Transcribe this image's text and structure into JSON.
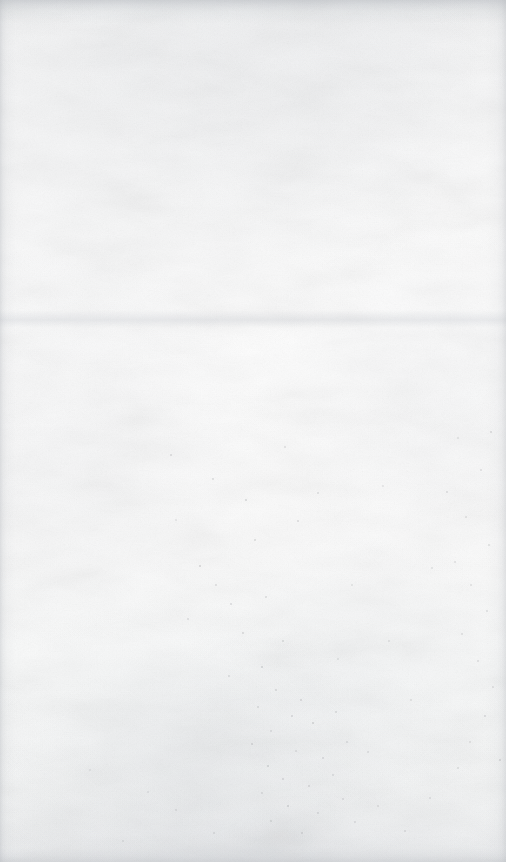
{
  "page": {
    "kind": "scanned-blank-page",
    "width": 506,
    "height": 862,
    "visible_text": "",
    "caption": ""
  },
  "appearance": {
    "base_color": "#fcfcfc",
    "paper_highlight": "#fdfdfd",
    "paper_shadow": "#f2f3f4",
    "edge_shadow_color": "#acb0b6",
    "speck_color": "#8d8f93",
    "crease_color": "#bec2c8"
  },
  "regions": {
    "top_edge_band": {
      "label": "",
      "y": 0,
      "height": 14
    },
    "bottom_edge_band": {
      "label": "",
      "y": 840,
      "height": 22
    },
    "left_edge_band": {
      "label": "",
      "x": 0,
      "width": 6
    },
    "right_edge_band": {
      "label": "",
      "x": 496,
      "width": 10
    },
    "crease": {
      "label": "",
      "y": 318
    }
  },
  "specks": [
    {
      "x": 171,
      "y": 455,
      "r": 1.0,
      "o": 0.3
    },
    {
      "x": 213,
      "y": 479,
      "r": 0.9,
      "o": 0.26
    },
    {
      "x": 246,
      "y": 500,
      "r": 1.1,
      "o": 0.32
    },
    {
      "x": 285,
      "y": 447,
      "r": 0.8,
      "o": 0.24
    },
    {
      "x": 298,
      "y": 521,
      "r": 1.0,
      "o": 0.3
    },
    {
      "x": 318,
      "y": 493,
      "r": 0.9,
      "o": 0.25
    },
    {
      "x": 255,
      "y": 540,
      "r": 1.0,
      "o": 0.28
    },
    {
      "x": 200,
      "y": 566,
      "r": 1.2,
      "o": 0.34
    },
    {
      "x": 216,
      "y": 585,
      "r": 0.9,
      "o": 0.24
    },
    {
      "x": 231,
      "y": 604,
      "r": 1.0,
      "o": 0.29
    },
    {
      "x": 188,
      "y": 619,
      "r": 0.8,
      "o": 0.22
    },
    {
      "x": 243,
      "y": 633,
      "r": 1.1,
      "o": 0.31
    },
    {
      "x": 266,
      "y": 597,
      "r": 0.9,
      "o": 0.26
    },
    {
      "x": 283,
      "y": 641,
      "r": 1.0,
      "o": 0.28
    },
    {
      "x": 262,
      "y": 667,
      "r": 1.2,
      "o": 0.33
    },
    {
      "x": 229,
      "y": 676,
      "r": 0.9,
      "o": 0.25
    },
    {
      "x": 276,
      "y": 690,
      "r": 1.0,
      "o": 0.3
    },
    {
      "x": 301,
      "y": 700,
      "r": 1.1,
      "o": 0.31
    },
    {
      "x": 258,
      "y": 707,
      "r": 0.9,
      "o": 0.26
    },
    {
      "x": 292,
      "y": 716,
      "r": 1.0,
      "o": 0.29
    },
    {
      "x": 313,
      "y": 723,
      "r": 1.2,
      "o": 0.34
    },
    {
      "x": 271,
      "y": 731,
      "r": 0.9,
      "o": 0.25
    },
    {
      "x": 336,
      "y": 712,
      "r": 1.0,
      "o": 0.28
    },
    {
      "x": 252,
      "y": 744,
      "r": 1.1,
      "o": 0.31
    },
    {
      "x": 296,
      "y": 751,
      "r": 0.9,
      "o": 0.24
    },
    {
      "x": 323,
      "y": 758,
      "r": 1.0,
      "o": 0.29
    },
    {
      "x": 268,
      "y": 766,
      "r": 1.2,
      "o": 0.33
    },
    {
      "x": 347,
      "y": 742,
      "r": 0.9,
      "o": 0.25
    },
    {
      "x": 283,
      "y": 779,
      "r": 1.0,
      "o": 0.3
    },
    {
      "x": 309,
      "y": 786,
      "r": 1.1,
      "o": 0.3
    },
    {
      "x": 262,
      "y": 793,
      "r": 0.9,
      "o": 0.24
    },
    {
      "x": 333,
      "y": 775,
      "r": 1.0,
      "o": 0.27
    },
    {
      "x": 288,
      "y": 806,
      "r": 1.2,
      "o": 0.33
    },
    {
      "x": 318,
      "y": 813,
      "r": 0.9,
      "o": 0.25
    },
    {
      "x": 271,
      "y": 821,
      "r": 1.0,
      "o": 0.28
    },
    {
      "x": 343,
      "y": 799,
      "r": 1.0,
      "o": 0.26
    },
    {
      "x": 355,
      "y": 822,
      "r": 0.9,
      "o": 0.24
    },
    {
      "x": 302,
      "y": 833,
      "r": 1.1,
      "o": 0.3
    },
    {
      "x": 378,
      "y": 806,
      "r": 0.9,
      "o": 0.23
    },
    {
      "x": 214,
      "y": 833,
      "r": 0.9,
      "o": 0.24
    },
    {
      "x": 176,
      "y": 810,
      "r": 0.8,
      "o": 0.21
    },
    {
      "x": 405,
      "y": 831,
      "r": 1.0,
      "o": 0.26
    },
    {
      "x": 430,
      "y": 798,
      "r": 0.9,
      "o": 0.22
    },
    {
      "x": 458,
      "y": 768,
      "r": 1.0,
      "o": 0.25
    },
    {
      "x": 470,
      "y": 742,
      "r": 0.9,
      "o": 0.23
    },
    {
      "x": 485,
      "y": 716,
      "r": 1.1,
      "o": 0.29
    },
    {
      "x": 493,
      "y": 687,
      "r": 0.9,
      "o": 0.24
    },
    {
      "x": 478,
      "y": 661,
      "r": 1.0,
      "o": 0.26
    },
    {
      "x": 462,
      "y": 634,
      "r": 0.9,
      "o": 0.23
    },
    {
      "x": 487,
      "y": 611,
      "r": 1.0,
      "o": 0.27
    },
    {
      "x": 471,
      "y": 585,
      "r": 0.9,
      "o": 0.23
    },
    {
      "x": 455,
      "y": 562,
      "r": 0.8,
      "o": 0.21
    },
    {
      "x": 489,
      "y": 545,
      "r": 1.0,
      "o": 0.25
    },
    {
      "x": 466,
      "y": 517,
      "r": 0.9,
      "o": 0.23
    },
    {
      "x": 447,
      "y": 492,
      "r": 1.0,
      "o": 0.26
    },
    {
      "x": 481,
      "y": 470,
      "r": 0.9,
      "o": 0.24
    },
    {
      "x": 491,
      "y": 432,
      "r": 1.1,
      "o": 0.3
    },
    {
      "x": 458,
      "y": 438,
      "r": 0.8,
      "o": 0.2
    },
    {
      "x": 500,
      "y": 760,
      "r": 1.2,
      "o": 0.32
    },
    {
      "x": 352,
      "y": 585,
      "r": 0.8,
      "o": 0.2
    },
    {
      "x": 389,
      "y": 641,
      "r": 0.9,
      "o": 0.22
    },
    {
      "x": 411,
      "y": 700,
      "r": 0.9,
      "o": 0.23
    },
    {
      "x": 368,
      "y": 752,
      "r": 0.8,
      "o": 0.21
    },
    {
      "x": 338,
      "y": 659,
      "r": 0.8,
      "o": 0.2
    },
    {
      "x": 148,
      "y": 792,
      "r": 0.8,
      "o": 0.19
    },
    {
      "x": 123,
      "y": 841,
      "r": 0.8,
      "o": 0.2
    },
    {
      "x": 90,
      "y": 770,
      "r": 0.7,
      "o": 0.17
    },
    {
      "x": 432,
      "y": 568,
      "r": 0.8,
      "o": 0.2
    },
    {
      "x": 176,
      "y": 520,
      "r": 0.8,
      "o": 0.19
    },
    {
      "x": 383,
      "y": 486,
      "r": 0.8,
      "o": 0.19
    }
  ]
}
